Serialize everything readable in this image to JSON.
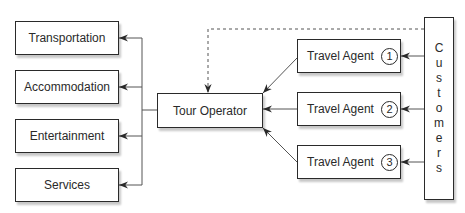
{
  "diagram": {
    "services": [
      {
        "label": "Transportation"
      },
      {
        "label": "Accommodation"
      },
      {
        "label": "Entertainment"
      },
      {
        "label": "Services"
      }
    ],
    "tour_operator": {
      "label": "Tour Operator"
    },
    "travel_agents": [
      {
        "label": "Travel Agent",
        "number": "1"
      },
      {
        "label": "Travel Agent",
        "number": "2"
      },
      {
        "label": "Travel Agent",
        "number": "3"
      }
    ],
    "customers": {
      "label": "Customers",
      "letters": [
        "C",
        "u",
        "s",
        "t",
        "o",
        "m",
        "e",
        "r",
        "s"
      ]
    },
    "edges": [
      {
        "from": "Tour Operator",
        "to": "Transportation",
        "style": "solid"
      },
      {
        "from": "Tour Operator",
        "to": "Accommodation",
        "style": "solid"
      },
      {
        "from": "Tour Operator",
        "to": "Entertainment",
        "style": "solid"
      },
      {
        "from": "Tour Operator",
        "to": "Services",
        "style": "solid"
      },
      {
        "from": "Travel Agent 1",
        "to": "Tour Operator",
        "style": "solid"
      },
      {
        "from": "Travel Agent 2",
        "to": "Tour Operator",
        "style": "solid"
      },
      {
        "from": "Travel Agent 3",
        "to": "Tour Operator",
        "style": "solid"
      },
      {
        "from": "Customers",
        "to": "Travel Agent 1",
        "style": "solid"
      },
      {
        "from": "Customers",
        "to": "Travel Agent 2",
        "style": "solid"
      },
      {
        "from": "Customers",
        "to": "Travel Agent 3",
        "style": "solid"
      },
      {
        "from": "Customers",
        "to": "Tour Operator",
        "style": "dashed"
      }
    ]
  }
}
